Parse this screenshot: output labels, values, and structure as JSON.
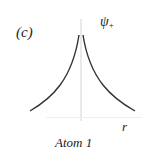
{
  "figure": {
    "panel_label": "(c)",
    "wavefunction_symbol": "ψ",
    "wavefunction_subscript": "+",
    "axis_label_x": "r",
    "caption": "Atom 1",
    "colors": {
      "curve": "#333333",
      "axis": "#d0d0d0",
      "text": "#222222"
    }
  },
  "curve": {
    "shape": "cusp exponential decay symmetric about atom position",
    "peak_x": 81,
    "peak_y": 34,
    "left_end": [
      30,
      111
    ],
    "right_end": [
      135,
      111
    ]
  }
}
